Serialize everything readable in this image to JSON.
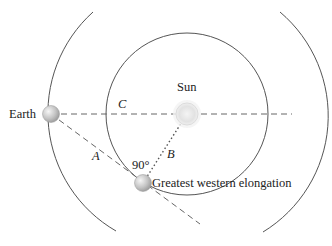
{
  "diagram": {
    "type": "orbital-geometry",
    "colors": {
      "line": "#555555",
      "text": "#222222",
      "sun": "#e4e4e4",
      "planet": "#c8c8c8"
    },
    "labels": {
      "earth": "Earth",
      "sun": "Sun",
      "elongation": "Greatest western elongation",
      "angle": "90°",
      "a": "A",
      "b": "B",
      "c": "C"
    },
    "bodies": [
      {
        "name": "Earth",
        "x": 51,
        "y": 114
      },
      {
        "name": "Sun",
        "x": 187,
        "y": 114
      },
      {
        "name": "Inferior planet",
        "x": 143,
        "y": 183
      }
    ],
    "orbits": [
      {
        "name": "inner-orbit",
        "cx": 187,
        "cy": 114,
        "r": 81
      },
      {
        "name": "earth-orbit",
        "cx": 187,
        "cy": 114,
        "r": 136
      }
    ]
  }
}
